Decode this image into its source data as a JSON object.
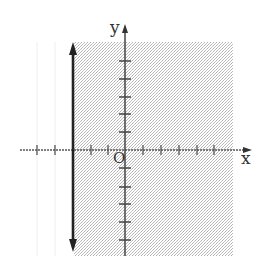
{
  "diagram": {
    "type": "coordinate-plane-inequality",
    "axes": {
      "x_label": "x",
      "y_label": "y",
      "origin_label": "O",
      "x_ticks": [
        -5,
        -4,
        -3,
        -2,
        -1,
        1,
        2,
        3,
        4,
        5
      ],
      "y_ticks": [
        -5,
        -4,
        -3,
        -2,
        -1,
        1,
        2,
        3,
        4,
        5
      ]
    },
    "boundary_line": {
      "equation": "x = -3",
      "style": "solid",
      "arrows": "both-ends"
    },
    "shaded_region": {
      "description": "x >= -3",
      "side": "right-of-line"
    },
    "colors": {
      "axis": "#444444",
      "boundary": "#222222",
      "shading": "#c8c8c8",
      "background": "#ffffff"
    }
  }
}
